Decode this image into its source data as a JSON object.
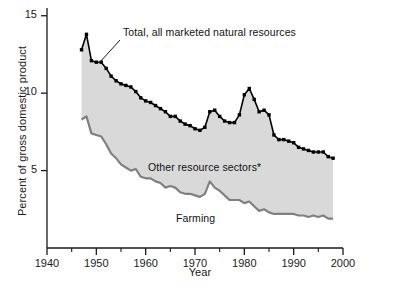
{
  "chart_data": {
    "type": "area",
    "title": "",
    "xlabel": "Year",
    "ylabel": "Percent of gross domestic product",
    "xlim": [
      1940,
      2000
    ],
    "ylim": [
      0,
      15
    ],
    "xticks_major": [
      1940,
      1950,
      1960,
      1970,
      1980,
      1990,
      2000
    ],
    "xticks_minor": [
      1945,
      1955,
      1965,
      1975,
      1985,
      1995
    ],
    "yticks_major": [
      5,
      10,
      15
    ],
    "grid": false,
    "legend_position": "inline-annotations",
    "annotations": [
      {
        "name": "total-label",
        "text": "Total, all marketed natural resources",
        "has_leader_line": true
      },
      {
        "name": "other-label",
        "text": "Other resource sectors*",
        "has_leader_line": false
      },
      {
        "name": "farming-label",
        "text": "Farming",
        "has_leader_line": false
      }
    ],
    "x": [
      1947,
      1948,
      1949,
      1950,
      1951,
      1952,
      1953,
      1954,
      1955,
      1956,
      1957,
      1958,
      1959,
      1960,
      1961,
      1962,
      1963,
      1964,
      1965,
      1966,
      1967,
      1968,
      1969,
      1970,
      1971,
      1972,
      1973,
      1974,
      1975,
      1976,
      1977,
      1978,
      1979,
      1980,
      1981,
      1982,
      1983,
      1984,
      1985,
      1986,
      1987,
      1988,
      1989,
      1990,
      1991,
      1992,
      1993,
      1994,
      1995,
      1996,
      1997,
      1998
    ],
    "series": [
      {
        "name": "Total, all marketed natural resources",
        "color": "#000000",
        "marker": "square",
        "values": [
          12.8,
          13.8,
          12.1,
          12.0,
          12.0,
          11.6,
          11.1,
          10.8,
          10.6,
          10.5,
          10.4,
          10.1,
          9.7,
          9.5,
          9.4,
          9.2,
          9.0,
          8.8,
          8.5,
          8.5,
          8.2,
          8.0,
          7.9,
          7.7,
          7.6,
          7.8,
          8.8,
          8.9,
          8.5,
          8.2,
          8.1,
          8.1,
          8.6,
          9.9,
          10.3,
          9.6,
          8.8,
          8.9,
          8.6,
          7.3,
          7.0,
          7.0,
          6.9,
          6.8,
          6.5,
          6.4,
          6.3,
          6.2,
          6.2,
          6.2,
          5.9,
          5.8
        ]
      },
      {
        "name": "Farming",
        "color": "#808080",
        "marker": "none",
        "values": [
          8.3,
          8.5,
          7.4,
          7.3,
          7.2,
          6.7,
          6.1,
          5.8,
          5.4,
          5.2,
          5.0,
          5.1,
          4.6,
          4.5,
          4.5,
          4.3,
          4.2,
          3.9,
          4.0,
          3.9,
          3.6,
          3.5,
          3.5,
          3.4,
          3.3,
          3.5,
          4.3,
          3.9,
          3.7,
          3.4,
          3.1,
          3.1,
          3.1,
          2.9,
          3.0,
          2.7,
          2.4,
          2.5,
          2.3,
          2.2,
          2.2,
          2.2,
          2.2,
          2.2,
          2.1,
          2.1,
          2.0,
          2.1,
          2.0,
          2.1,
          1.9,
          1.9
        ]
      }
    ],
    "shaded_band": {
      "name": "Other resource sectors*",
      "fill_color": "#d9d9d9",
      "between": [
        "Farming",
        "Total, all marketed natural resources"
      ]
    }
  },
  "axes": {
    "x_tick_labels": [
      "1940",
      "1950",
      "1960",
      "1970",
      "1980",
      "1990",
      "2000"
    ],
    "y_tick_labels": [
      "5",
      "10",
      "15"
    ],
    "x_axis_title": "Year",
    "y_axis_title": "Percent of gross domestic product"
  },
  "colors": {
    "background": "#ffffff",
    "axis": "#1a1a1a",
    "total_line": "#000000",
    "farming_line": "#808080",
    "band_fill": "#d9d9d9"
  }
}
